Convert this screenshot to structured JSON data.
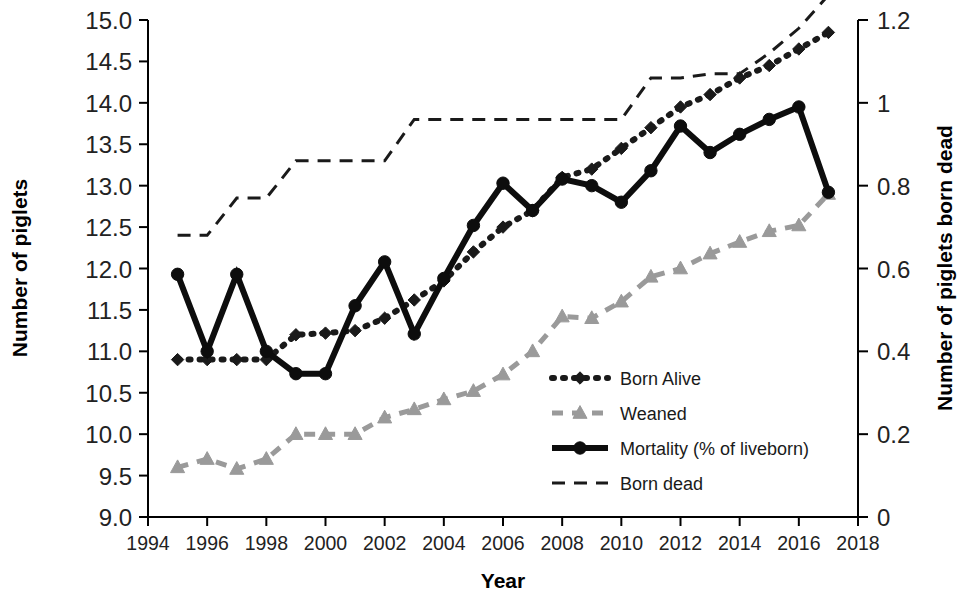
{
  "chart_data": {
    "type": "line",
    "title": "",
    "xlabel": "Year",
    "ylabel": "Number of piglets",
    "y2label": "Number of piglets born dead",
    "xlim": [
      1994,
      2018
    ],
    "ylim": [
      9.0,
      15.0
    ],
    "y2lim": [
      0,
      1.2
    ],
    "grid": false,
    "legend_position": "center-right-inside",
    "x_ticks": [
      "1994",
      "1996",
      "1998",
      "2000",
      "2002",
      "2004",
      "2006",
      "2008",
      "2010",
      "2012",
      "2014",
      "2016",
      "2018"
    ],
    "y_ticks": [
      "9.0",
      "9.5",
      "10.0",
      "10.5",
      "11.0",
      "11.5",
      "12.0",
      "12.5",
      "13.0",
      "13.5",
      "14.0",
      "14.5",
      "15.0"
    ],
    "y2_ticks": [
      "0",
      "0.2",
      "0.4",
      "0.6",
      "0.8",
      "1",
      "1.2"
    ],
    "x": [
      1995,
      1996,
      1997,
      1998,
      1999,
      2000,
      2001,
      2002,
      2003,
      2004,
      2005,
      2006,
      2007,
      2008,
      2009,
      2010,
      2011,
      2012,
      2013,
      2014,
      2015,
      2016,
      2017
    ],
    "series": [
      {
        "name": "Born Alive",
        "axis": "left",
        "style": "dotted",
        "marker": "diamond",
        "color": "#1a1a1a",
        "values": [
          10.9,
          10.9,
          10.9,
          10.9,
          11.2,
          11.22,
          11.25,
          11.4,
          11.62,
          11.85,
          12.2,
          12.5,
          12.7,
          13.1,
          13.2,
          13.45,
          13.7,
          13.95,
          14.1,
          14.3,
          14.45,
          14.65,
          14.85
        ]
      },
      {
        "name": "Weaned",
        "axis": "left",
        "style": "dashed",
        "marker": "triangle",
        "color": "#9a9a9a",
        "values": [
          9.6,
          9.7,
          9.58,
          9.7,
          10.0,
          10.0,
          10.0,
          10.2,
          10.3,
          10.42,
          10.52,
          10.72,
          11.0,
          11.42,
          11.4,
          11.6,
          11.9,
          12.0,
          12.18,
          12.32,
          12.45,
          12.52,
          12.9
        ]
      },
      {
        "name": "Mortality (% of liveborn)",
        "axis": "left",
        "style": "solid",
        "marker": "circle",
        "color": "#0d0d0d",
        "values": [
          11.93,
          11.0,
          11.93,
          11.0,
          10.73,
          10.73,
          11.55,
          12.08,
          11.21,
          11.88,
          12.52,
          13.03,
          12.7,
          13.08,
          13.0,
          12.8,
          13.18,
          13.72,
          13.4,
          13.62,
          13.8,
          13.95,
          12.92
        ]
      },
      {
        "name": "Born dead",
        "axis": "right",
        "style": "dashed-thin",
        "marker": "none",
        "color": "#1a1a1a",
        "values": [
          0.68,
          0.68,
          0.77,
          0.77,
          0.86,
          0.86,
          0.86,
          0.86,
          0.96,
          0.96,
          0.96,
          0.96,
          0.96,
          0.96,
          0.96,
          0.96,
          1.06,
          1.06,
          1.07,
          1.07,
          1.12,
          1.18,
          1.26
        ]
      }
    ]
  },
  "legend": {
    "items": [
      {
        "label": "Born Alive"
      },
      {
        "label": "Weaned"
      },
      {
        "label": "Mortality (% of liveborn)"
      },
      {
        "label": "Born dead"
      }
    ]
  },
  "axes": {
    "left_title": "Number of piglets",
    "right_title": "Number of piglets born dead",
    "x_title": "Year"
  }
}
